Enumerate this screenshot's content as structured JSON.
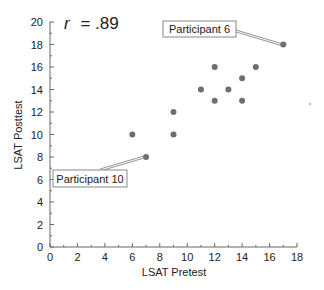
{
  "chart_data": {
    "type": "scatter",
    "title": "",
    "annotation_r": "r = .89",
    "r_label": "r",
    "r_value": "= .89",
    "xlabel": "LSAT Pretest",
    "ylabel": "LSAT Posttest",
    "xlim": [
      0,
      18
    ],
    "ylim": [
      0,
      20
    ],
    "x_ticks": [
      0,
      2,
      4,
      6,
      8,
      10,
      12,
      14,
      16,
      18
    ],
    "y_ticks": [
      0,
      2,
      4,
      6,
      8,
      10,
      12,
      14,
      16,
      18,
      20
    ],
    "grid": false,
    "legend": null,
    "points": [
      {
        "x": 6,
        "y": 10
      },
      {
        "x": 7,
        "y": 8,
        "label": "Participant 10"
      },
      {
        "x": 9,
        "y": 12
      },
      {
        "x": 9,
        "y": 10
      },
      {
        "x": 11,
        "y": 14
      },
      {
        "x": 12,
        "y": 16
      },
      {
        "x": 12,
        "y": 13
      },
      {
        "x": 13,
        "y": 14
      },
      {
        "x": 14,
        "y": 15
      },
      {
        "x": 14,
        "y": 13
      },
      {
        "x": 15,
        "y": 16
      },
      {
        "x": 17,
        "y": 18,
        "label": "Participant 6"
      }
    ],
    "callouts": [
      {
        "text": "Participant 6",
        "point": {
          "x": 17,
          "y": 18
        }
      },
      {
        "text": "Participant 10",
        "point": {
          "x": 7,
          "y": 8
        }
      }
    ],
    "colors": {
      "point": "#6e6e6e",
      "axis": "#666666",
      "text": "#222222"
    }
  }
}
